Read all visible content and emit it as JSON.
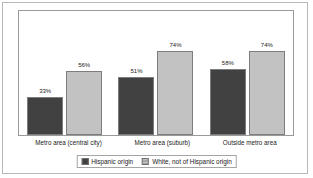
{
  "chart_data": {
    "type": "bar",
    "title": "",
    "subtitle": "",
    "xlabel": "",
    "ylabel": "",
    "ylim": [
      0,
      100
    ],
    "grid": false,
    "legend_position": "bottom",
    "categories": [
      "Metro area (central city)",
      "Metro area (suburb)",
      "Outside metro area"
    ],
    "series": [
      {
        "name": "Hispanic origin",
        "color": "#414141",
        "values": [
          33,
          51,
          58
        ],
        "labels": [
          "33%",
          "51%",
          "58%"
        ]
      },
      {
        "name": "White, not of Hispanic origin",
        "color": "#c2c2c2",
        "values": [
          56,
          74,
          74
        ],
        "labels": [
          "56%",
          "74%",
          "74%"
        ]
      }
    ]
  },
  "legend": {
    "items": [
      {
        "label": "Hispanic origin",
        "swatch": "dark-swatch-icon"
      },
      {
        "label": "White, not of Hispanic origin",
        "swatch": "light-swatch-icon"
      }
    ]
  }
}
